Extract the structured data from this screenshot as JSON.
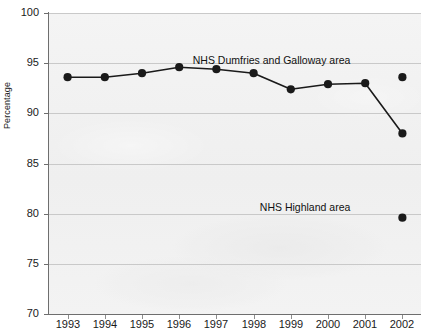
{
  "chart_data": {
    "type": "line",
    "title": "",
    "subtitle": "",
    "xlabel": "",
    "ylabel": "Percentage",
    "xlim": [
      1992.5,
      2002.5
    ],
    "ylim": [
      70,
      100
    ],
    "ytick_labels": [
      "100",
      "95",
      "90",
      "85",
      "80",
      "75",
      "70"
    ],
    "yticks": [
      100,
      95,
      90,
      85,
      80,
      75,
      70
    ],
    "grid": "horizontal",
    "legend_position": "inline-annotation",
    "categories": [
      1993,
      1994,
      1995,
      1996,
      1997,
      1998,
      1999,
      2000,
      2001,
      2002
    ],
    "xtick_labels": [
      "1993",
      "1994",
      "1995",
      "1996",
      "1997",
      "1998",
      "1999",
      "2000",
      "2001",
      "2002"
    ],
    "series": [
      {
        "name": "NHS Dumfries and Galloway area",
        "marker": "filled-circle",
        "line": "solid",
        "x": [
          1993,
          1994,
          1995,
          1996,
          1997,
          1998,
          1999,
          2000,
          2001,
          2002
        ],
        "values": [
          93.6,
          93.6,
          94.0,
          94.6,
          94.4,
          94.0,
          92.4,
          92.9,
          93.0,
          88.0
        ]
      },
      {
        "name": "NHS Dumfries and Galloway area (2002 separate point)",
        "marker": "filled-circle",
        "line": "none",
        "x": [
          2002
        ],
        "values": [
          93.6
        ]
      },
      {
        "name": "NHS Highland area",
        "marker": "filled-circle",
        "line": "none",
        "x": [
          2002
        ],
        "values": [
          79.6
        ]
      }
    ],
    "annotations": [
      {
        "text": "NHS Dumfries and Galloway area",
        "x": 2000.6,
        "y": 95.2
      },
      {
        "text": "NHS Highland area",
        "x": 2000.6,
        "y": 80.6
      }
    ]
  },
  "colors": {
    "series_line": "#1a1a1a",
    "marker": "#1a1a1a",
    "plot_background": "#f2f2f2",
    "gridline": "#c9c9c9",
    "axis": "#6e6e6e",
    "text": "#1a1a1a"
  }
}
